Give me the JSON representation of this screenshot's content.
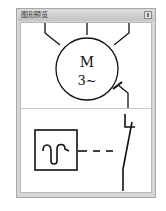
{
  "window": {
    "title": "图形预览",
    "close_button": "□"
  },
  "preview_top": {
    "symbol": "motor",
    "label_line1": "M",
    "label_line2": "3~"
  },
  "preview_bottom": {
    "symbol": "thermal-relay-contact"
  }
}
